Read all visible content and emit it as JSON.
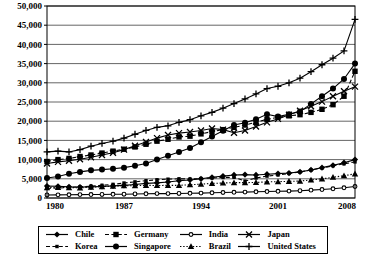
{
  "chart_data": {
    "type": "line",
    "title": "",
    "xlabel": "",
    "ylabel": "",
    "xlim": [
      1980,
      2008
    ],
    "ylim": [
      0,
      50000
    ],
    "ytick_step": 5000,
    "grid": true,
    "legend_position": "bottom",
    "x": [
      1980,
      1981,
      1982,
      1983,
      1984,
      1985,
      1986,
      1987,
      1988,
      1989,
      1990,
      1991,
      1992,
      1993,
      1994,
      1995,
      1996,
      1997,
      1998,
      1999,
      2000,
      2001,
      2002,
      2003,
      2004,
      2005,
      2006,
      2007,
      2008
    ],
    "yticks": [
      "0",
      "5,000",
      "10,000",
      "15,000",
      "20,000",
      "25,000",
      "30,000",
      "35,000",
      "40,000",
      "45,000",
      "50,000"
    ],
    "xticks": [
      "1980",
      "1987",
      "1994",
      "2001",
      "2008"
    ],
    "series": [
      {
        "name": "Chile",
        "marker": "diamond",
        "dash": "solid",
        "color": "#000000",
        "values": [
          3100,
          3050,
          2900,
          2850,
          2900,
          3000,
          3150,
          3300,
          3500,
          3800,
          3950,
          4150,
          4500,
          4700,
          5000,
          5400,
          5700,
          6000,
          6100,
          6000,
          6200,
          6350,
          6500,
          6800,
          7300,
          7900,
          8500,
          9200,
          10000
        ]
      },
      {
        "name": "Germany",
        "marker": "square",
        "dash": "dashed",
        "color": "#000000",
        "values": [
          9500,
          10000,
          10300,
          10800,
          11200,
          11700,
          12200,
          12700,
          13300,
          14000,
          14800,
          15300,
          15900,
          16100,
          16700,
          17300,
          17800,
          18400,
          19000,
          19700,
          20500,
          21000,
          21400,
          21700,
          22300,
          23100,
          24300,
          26500,
          33000
        ]
      },
      {
        "name": "India",
        "marker": "small-circle",
        "dash": "solid",
        "color": "#000000",
        "values": [
          800,
          820,
          840,
          880,
          900,
          930,
          960,
          990,
          1050,
          1100,
          1150,
          1150,
          1180,
          1220,
          1280,
          1350,
          1430,
          1480,
          1540,
          1620,
          1680,
          1740,
          1800,
          1900,
          2050,
          2200,
          2400,
          2650,
          3000
        ]
      },
      {
        "name": "Japan",
        "marker": "x",
        "dash": "solid",
        "color": "#000000",
        "values": [
          9000,
          9400,
          9700,
          10100,
          10600,
          11200,
          11800,
          12600,
          13600,
          14600,
          15600,
          16400,
          16900,
          17200,
          17600,
          18100,
          17800,
          17000,
          17600,
          18600,
          19700,
          20600,
          21700,
          22700,
          23900,
          25100,
          26500,
          27800,
          29000
        ]
      },
      {
        "name": "Korea",
        "marker": "small-square",
        "dash": "dashed",
        "color": "#000000",
        "values": [
          2500,
          2600,
          2750,
          2900,
          3100,
          3300,
          3550,
          3900,
          4200,
          4500,
          4750,
          4900,
          5000,
          4950,
          5050,
          5200,
          5350,
          5400,
          4400,
          5200,
          5700,
          6000,
          6400,
          6800,
          7300,
          7800,
          8400,
          8900,
          9400
        ]
      },
      {
        "name": "Singapore",
        "marker": "circle",
        "dash": "solid",
        "color": "#000000",
        "values": [
          5200,
          5600,
          6300,
          6800,
          7200,
          7400,
          7600,
          7900,
          8400,
          9000,
          10000,
          11000,
          12000,
          13000,
          14500,
          16000,
          17500,
          19000,
          19600,
          20500,
          21800,
          21200,
          21800,
          22500,
          24500,
          26500,
          28500,
          31000,
          35000
        ]
      },
      {
        "name": "Brazil",
        "marker": "triangle",
        "dash": "dotted",
        "color": "#000000",
        "values": [
          2700,
          2750,
          2700,
          2650,
          2800,
          2950,
          3100,
          3200,
          3200,
          3300,
          3250,
          3300,
          3300,
          3450,
          3600,
          3800,
          3900,
          4000,
          4000,
          4050,
          4200,
          4250,
          4350,
          4400,
          4700,
          5000,
          5400,
          5800,
          6300
        ]
      },
      {
        "name": "United States",
        "marker": "plus",
        "dash": "solid",
        "color": "#000000",
        "values": [
          12000,
          12200,
          12000,
          12600,
          13500,
          14200,
          14800,
          15600,
          16600,
          17600,
          18400,
          18800,
          19700,
          20400,
          21400,
          22300,
          23400,
          24600,
          25800,
          27100,
          28500,
          29100,
          30000,
          31200,
          32900,
          34700,
          36400,
          38300,
          46500
        ]
      }
    ]
  },
  "legend": {
    "entries": [
      {
        "label": "Chile",
        "marker": "diamond",
        "dash": "solid"
      },
      {
        "label": "Germany",
        "marker": "square",
        "dash": "dashed"
      },
      {
        "label": "India",
        "marker": "small-circle",
        "dash": "solid"
      },
      {
        "label": "Japan",
        "marker": "x",
        "dash": "solid"
      },
      {
        "label": "Korea",
        "marker": "small-square",
        "dash": "dashed"
      },
      {
        "label": "Singapore",
        "marker": "circle",
        "dash": "solid"
      },
      {
        "label": "Brazil",
        "marker": "triangle",
        "dash": "dotted"
      },
      {
        "label": "United States",
        "marker": "plus",
        "dash": "solid"
      }
    ]
  },
  "colors": {
    "ink": "#000000",
    "grid": "#555555",
    "plot_background": "#ffffff",
    "page_background": "#ffffff"
  }
}
